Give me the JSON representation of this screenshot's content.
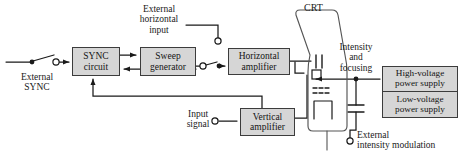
{
  "diagram": {
    "style": {
      "block_fill": "#d6d6d6",
      "block_stroke": "#3c3c3c",
      "line_color": "#1a1a1a",
      "text_color": "#1a1a1a",
      "background": "#ffffff"
    },
    "blocks": [
      {
        "id": "sync-circuit",
        "label_line1": "SYNC",
        "label_line2": "circuit",
        "x": 72,
        "y": 47,
        "w": 48,
        "h": 29,
        "font": 9.5
      },
      {
        "id": "sweep-generator",
        "label_line1": "Sweep",
        "label_line2": "generator",
        "x": 140,
        "y": 47,
        "w": 56,
        "h": 29,
        "font": 9.5
      },
      {
        "id": "horizontal-amplifier",
        "label_line1": "Horizontal",
        "label_line2": "amplifier",
        "x": 228,
        "y": 48,
        "w": 62,
        "h": 27,
        "font": 9.5
      },
      {
        "id": "vertical-amplifier",
        "label_line1": "Vertical",
        "label_line2": "amplifier",
        "x": 240,
        "y": 108,
        "w": 55,
        "h": 28,
        "font": 9.5
      },
      {
        "id": "high-voltage-supply",
        "label_line1": "High-voltage",
        "label_line2": "power supply",
        "x": 382,
        "y": 66,
        "w": 76,
        "h": 26,
        "font": 9.2
      },
      {
        "id": "low-voltage-supply",
        "label_line1": "Low-voltage",
        "label_line2": "power supply",
        "x": 382,
        "y": 92,
        "w": 76,
        "h": 26,
        "font": 9.2
      }
    ],
    "labels": [
      {
        "id": "crt-label",
        "text": "CRT",
        "x": 304,
        "y": 4,
        "font": 10
      },
      {
        "id": "external-horizontal-input",
        "line1": "External",
        "line2": "horizontal",
        "line3": "input",
        "x": 138,
        "y": 5,
        "font": 9.5
      },
      {
        "id": "external-sync",
        "line1": "External",
        "line2": "SYNC",
        "x": 12,
        "y": 76,
        "font": 9.5
      },
      {
        "id": "input-signal",
        "line1": "Input",
        "line2": "signal",
        "x": 185,
        "y": 101,
        "font": 9.5
      },
      {
        "id": "intensity-and-focusing",
        "line1": "Intensity",
        "line2": "and",
        "line3": "focusing",
        "x": 334,
        "y": 43,
        "font": 9.5
      },
      {
        "id": "external-intensity-modulation",
        "line1": "External",
        "line2": "intensity modulation",
        "x": 357,
        "y": 133,
        "font": 9.5
      }
    ],
    "terminals": [
      {
        "id": "external-horizontal-input-terminal",
        "cx": 218,
        "cy": 41,
        "r": 3.2,
        "type": "open"
      },
      {
        "id": "external-sync-terminal",
        "cx": 56,
        "cy": 62,
        "r": 3.2,
        "type": "open"
      },
      {
        "id": "external-sync-pivot",
        "cx": 32,
        "cy": 62,
        "r": 2.4,
        "type": "filled"
      },
      {
        "id": "sweep-switch-left-contact",
        "cx": 203,
        "cy": 66,
        "r": 3.2,
        "type": "open"
      },
      {
        "id": "sweep-switch-right-contact",
        "cx": 219,
        "cy": 66,
        "r": 2.4,
        "type": "filled"
      },
      {
        "id": "input-signal-terminal",
        "cx": 215,
        "cy": 121,
        "r": 3.2,
        "type": "open"
      },
      {
        "id": "intensity-junction-dot",
        "cx": 356,
        "cy": 79,
        "r": 2.4,
        "type": "filled"
      },
      {
        "id": "external-intensity-terminal",
        "cx": 350,
        "cy": 141,
        "r": 3.2,
        "type": "open"
      }
    ],
    "crt": {
      "id": "crt-tube",
      "elements": [
        "horizontal-deflection-plates",
        "vertical-deflection-plate",
        "grid-electrodes",
        "cathode-heater"
      ]
    },
    "connections": [
      "external-sync-to-sync-circuit",
      "sync-circuit-to-sweep-generator",
      "sweep-generator-to-sync-circuit",
      "sweep-generator-to-horizontal-amplifier",
      "external-horizontal-input-to-horizontal-amplifier",
      "horizontal-amplifier-to-crt-plates",
      "vertical-amplifier-to-crt-plates",
      "input-signal-to-vertical-amplifier",
      "vertical-feedback-to-sync-circuit",
      "high-voltage-supply-to-crt",
      "external-intensity-modulation-to-crt"
    ]
  }
}
